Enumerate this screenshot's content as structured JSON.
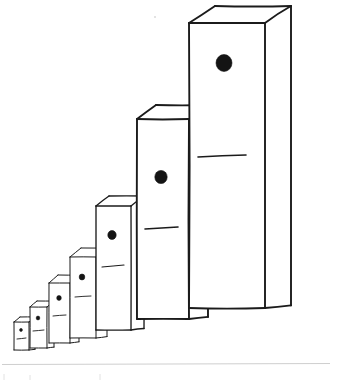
{
  "illustration": {
    "title": "Hand-drawn domino blocks in ascending size",
    "description": "Seven rectangular upright domino-like blocks drawn in loose pen lines, arranged left to right from smallest to largest, each shown in three-quarter perspective with a visible top face and right side face.",
    "style": "pen-and-ink sketch",
    "background_color": "#ffffff",
    "ink_color": "#1b1b1b",
    "pip_color": "#141414",
    "canvas": {
      "width": 353,
      "height": 380
    },
    "blocks": [
      {
        "index": 1,
        "name": "domino-block-1",
        "size_label": "smallest",
        "front": {
          "x": 14,
          "y": 322,
          "width": 15,
          "height": 28
        },
        "depth_x": 6,
        "depth_y": 5,
        "pip": {
          "cx": 21,
          "cy": 330,
          "r": 1.4
        },
        "divider": {
          "x1": 17,
          "y1": 339,
          "x2": 26,
          "y2": 338
        }
      },
      {
        "index": 2,
        "name": "domino-block-2",
        "size_label": "very small",
        "front": {
          "x": 30,
          "y": 307,
          "width": 17,
          "height": 41
        },
        "depth_x": 7,
        "depth_y": 6,
        "pip": {
          "cx": 38,
          "cy": 318,
          "r": 1.8
        },
        "divider": {
          "x1": 33,
          "y1": 331,
          "x2": 44,
          "y2": 330
        }
      },
      {
        "index": 3,
        "name": "domino-block-3",
        "size_label": "small",
        "front": {
          "x": 49,
          "y": 283,
          "width": 21,
          "height": 60
        },
        "depth_x": 9,
        "depth_y": 8,
        "pip": {
          "cx": 59,
          "cy": 298,
          "r": 2.3
        },
        "divider": {
          "x1": 53,
          "y1": 316,
          "x2": 66,
          "y2": 315
        }
      },
      {
        "index": 4,
        "name": "domino-block-4",
        "size_label": "medium-small",
        "front": {
          "x": 70,
          "y": 257,
          "width": 26,
          "height": 81
        },
        "depth_x": 11,
        "depth_y": 9,
        "pip": {
          "cx": 82,
          "cy": 277,
          "r": 2.8
        },
        "divider": {
          "x1": 75,
          "y1": 297,
          "x2": 91,
          "y2": 296
        }
      },
      {
        "index": 5,
        "name": "domino-block-5",
        "size_label": "medium",
        "front": {
          "x": 96,
          "y": 206,
          "width": 35,
          "height": 124
        },
        "depth_x": 13,
        "depth_y": 10,
        "pip": {
          "cx": 112,
          "cy": 235,
          "r": 4.2
        },
        "divider": {
          "x1": 102,
          "y1": 267,
          "x2": 124,
          "y2": 265
        }
      },
      {
        "index": 6,
        "name": "domino-block-6",
        "size_label": "large",
        "front": {
          "x": 137,
          "y": 119,
          "width": 52,
          "height": 200
        },
        "depth_x": 19,
        "depth_y": 14,
        "pip": {
          "cx": 161,
          "cy": 177,
          "r": 6.2
        },
        "divider": {
          "x1": 145,
          "y1": 229,
          "x2": 178,
          "y2": 227
        }
      },
      {
        "index": 7,
        "name": "domino-block-7",
        "size_label": "largest",
        "front": {
          "x": 189,
          "y": 23,
          "width": 76,
          "height": 285
        },
        "depth_x": 26,
        "depth_y": 17,
        "pip": {
          "cx": 224,
          "cy": 63,
          "r": 8.0
        },
        "divider": {
          "x1": 198,
          "y1": 157,
          "x2": 246,
          "y2": 155
        }
      }
    ],
    "footer": {
      "rule_y": 364,
      "rule_x1": 2,
      "rule_x2": 330,
      "faint_marks": [
        {
          "x1": 4,
          "y1": 374,
          "x2": 4,
          "y2": 380
        },
        {
          "x1": 30,
          "y1": 375,
          "x2": 30,
          "y2": 380
        },
        {
          "x1": 100,
          "y1": 374,
          "x2": 100,
          "y2": 380
        }
      ]
    },
    "stray_specks": [
      {
        "cx": 155,
        "cy": 17,
        "r": 1.1
      }
    ]
  }
}
